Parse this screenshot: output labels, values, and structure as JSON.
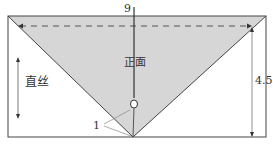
{
  "diagram": {
    "labels": {
      "top_width": "9",
      "right_height": "4.5",
      "grain": "直丝",
      "face": "正面",
      "corner_label": "1"
    },
    "colors": {
      "fill": "#d6d6d6",
      "stroke": "#444444",
      "background": "#ffffff"
    }
  }
}
